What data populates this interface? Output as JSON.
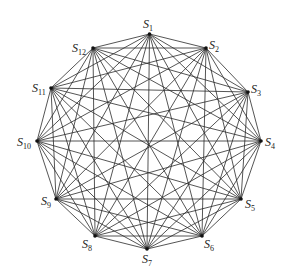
{
  "diagram": {
    "type": "complete-graph",
    "center": [
      149,
      141
    ],
    "radius": 108,
    "colors": {
      "edge": "#2a2a2a",
      "vertex": "#111111",
      "label": "#222222",
      "background": "#ffffff"
    },
    "vertices": [
      {
        "id": "S1",
        "base": "S",
        "sub": "1",
        "x": 149.5,
        "y": 34,
        "label_x": 143,
        "label_y": 28,
        "anchor": "start"
      },
      {
        "id": "S2",
        "base": "S",
        "sub": "2",
        "x": 206,
        "y": 48,
        "label_x": 209,
        "label_y": 49,
        "anchor": "start"
      },
      {
        "id": "S3",
        "base": "S",
        "sub": "3",
        "x": 248,
        "y": 92,
        "label_x": 251,
        "label_y": 93,
        "anchor": "start"
      },
      {
        "id": "S4",
        "base": "S",
        "sub": "4",
        "x": 261,
        "y": 141,
        "label_x": 265,
        "label_y": 146,
        "anchor": "start"
      },
      {
        "id": "S5",
        "base": "S",
        "sub": "5",
        "x": 241,
        "y": 199,
        "label_x": 245,
        "label_y": 208,
        "anchor": "start"
      },
      {
        "id": "S6",
        "base": "S",
        "sub": "6",
        "x": 202,
        "y": 236,
        "label_x": 204,
        "label_y": 248,
        "anchor": "start"
      },
      {
        "id": "S7",
        "base": "S",
        "sub": "7",
        "x": 147,
        "y": 249,
        "label_x": 142,
        "label_y": 263,
        "anchor": "start"
      },
      {
        "id": "S8",
        "base": "S",
        "sub": "8",
        "x": 95,
        "y": 236,
        "label_x": 82,
        "label_y": 248,
        "anchor": "start"
      },
      {
        "id": "S9",
        "base": "S",
        "sub": "9",
        "x": 56,
        "y": 199,
        "label_x": 41,
        "label_y": 205,
        "anchor": "start"
      },
      {
        "id": "S10",
        "base": "S",
        "sub": "10",
        "x": 37,
        "y": 141,
        "label_x": 17,
        "label_y": 146,
        "anchor": "start"
      },
      {
        "id": "S11",
        "base": "S",
        "sub": "11",
        "x": 51,
        "y": 88,
        "label_x": 32,
        "label_y": 92,
        "anchor": "start"
      },
      {
        "id": "S12",
        "base": "S",
        "sub": "12",
        "x": 93,
        "y": 48,
        "label_x": 72,
        "label_y": 52,
        "anchor": "start"
      }
    ],
    "edges": "all pairs (66 edges)"
  }
}
